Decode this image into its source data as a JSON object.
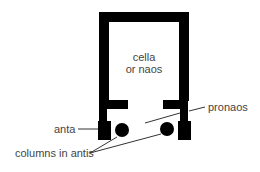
{
  "diagram": {
    "type": "Greek temple plan (in antis)",
    "colors": {
      "walls": "#000000",
      "text": "#444444",
      "lines": "#333333",
      "background": "#ffffff"
    }
  },
  "labels": {
    "cella_line1": "cella",
    "cella_line2": "or naos",
    "pronaos": "pronaos",
    "anta": "anta",
    "columns": "columns in antis"
  },
  "elements": [
    {
      "id": "cella",
      "label": "cella or naos"
    },
    {
      "id": "pronaos",
      "label": "pronaos"
    },
    {
      "id": "anta-left",
      "label": "anta"
    },
    {
      "id": "column-left",
      "label": "columns in antis"
    },
    {
      "id": "column-right",
      "label": "columns in antis"
    }
  ]
}
